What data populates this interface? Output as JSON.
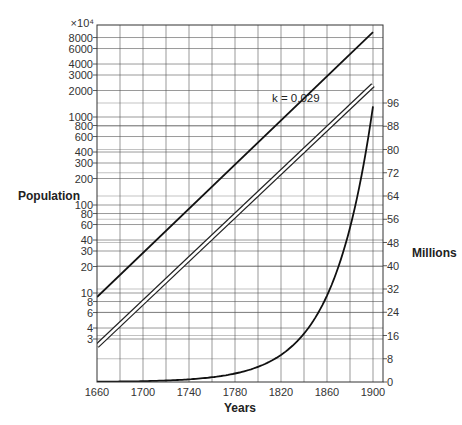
{
  "chart_data": {
    "type": "line",
    "title": "",
    "xlabel": "Years",
    "ylabel_left": "Population",
    "ylabel_right": "Millions",
    "x_ticks": [
      1660,
      1700,
      1740,
      1780,
      1820,
      1860,
      1900
    ],
    "x_range": [
      1660,
      1900
    ],
    "x_grid_step": 20,
    "left_axis": {
      "scale": "log",
      "multiplier_label": "×10⁴",
      "tick_labels": [
        "8000",
        "6000",
        "4000",
        "3000",
        "2000",
        "1000",
        "800",
        "600",
        "400",
        "300",
        "200",
        "100",
        "80",
        "60",
        "40",
        "30",
        "20",
        "10",
        "8",
        "6",
        "4",
        "3"
      ],
      "tick_values": [
        8000,
        6000,
        4000,
        3000,
        2000,
        1000,
        800,
        600,
        400,
        300,
        200,
        100,
        80,
        60,
        40,
        30,
        20,
        10,
        8,
        6,
        4,
        3
      ]
    },
    "right_axis": {
      "scale": "linear",
      "range": [
        0,
        96
      ],
      "tick_labels": [
        "0",
        "8",
        "16",
        "24",
        "32",
        "40",
        "48",
        "56",
        "64",
        "72",
        "80",
        "88",
        "96"
      ]
    },
    "annotations": [
      {
        "text": "k = 0.029",
        "x": 1820,
        "y_log": 1300
      }
    ],
    "series": [
      {
        "name": "log-scale line (solid)",
        "axis": "left",
        "style": "solid",
        "x": [
          1660,
          1900
        ],
        "values": [
          9,
          9200
        ]
      },
      {
        "name": "log-scale line (double)",
        "axis": "left",
        "style": "double",
        "x": [
          1660,
          1900
        ],
        "values": [
          2.5,
          2300
        ]
      },
      {
        "name": "exponential growth k = 0.029",
        "axis": "right",
        "style": "solid",
        "x": [
          1660,
          1700,
          1740,
          1780,
          1800,
          1820,
          1840,
          1860,
          1880,
          1900
        ],
        "values": [
          0.09,
          0.29,
          0.93,
          2.9,
          5.2,
          9.3,
          16.5,
          29.5,
          52,
          92
        ]
      }
    ],
    "grid": true,
    "legend": null
  }
}
